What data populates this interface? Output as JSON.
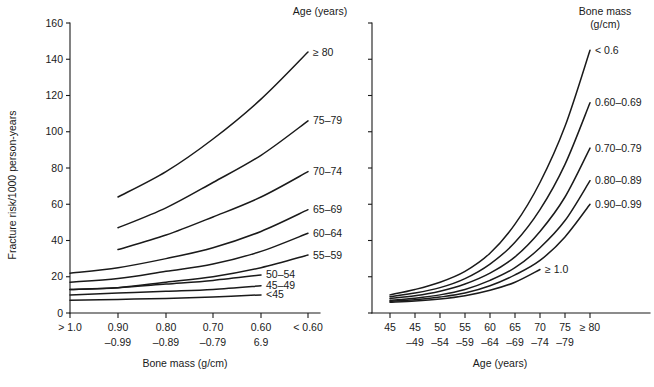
{
  "figure": {
    "background_color": "#ffffff",
    "line_color": "#1a1a1a"
  },
  "chart_data": [
    {
      "id": "left-panel",
      "type": "line",
      "title": "",
      "legend_title": "Age (years)",
      "legend_position": "right-of-plot",
      "grid": false,
      "xlabel": "Bone mass (g/cm)",
      "ylabel": "Fracture risk/1000 person-years",
      "ylim": [
        0,
        160
      ],
      "yticks": [
        0,
        20,
        40,
        60,
        80,
        100,
        120,
        140,
        160
      ],
      "categories": [
        "> 1.0",
        "0.90-0.99",
        "0.80-0.89",
        "0.70-0.79",
        "0.60-6.9",
        "< 0.60"
      ],
      "xtick_labels_top": [
        "> 1.0",
        "0.90",
        "0.80",
        "0.70",
        "0.60",
        "< 0.60"
      ],
      "xtick_labels_bottom": [
        "",
        "–0.99",
        "–0.89",
        "–0.79",
        "6.9",
        ""
      ],
      "series": [
        {
          "name": "≥ 80",
          "label": "≥ 80",
          "start_index": 1,
          "values": [
            null,
            64,
            78,
            96,
            118,
            144
          ]
        },
        {
          "name": "75–79",
          "label": "75–79",
          "start_index": 1,
          "values": [
            null,
            47,
            58,
            72,
            87,
            106
          ]
        },
        {
          "name": "70–74",
          "label": "70–74",
          "start_index": 1,
          "values": [
            null,
            35,
            43,
            53,
            64,
            78
          ]
        },
        {
          "name": "65–69",
          "label": "65–69",
          "start_index": 0,
          "values": [
            22,
            25,
            30,
            36,
            45,
            57
          ]
        },
        {
          "name": "60–64",
          "label": "60–64",
          "start_index": 0,
          "values": [
            17,
            19,
            23,
            27,
            34,
            44
          ]
        },
        {
          "name": "55–59",
          "label": "55–59",
          "start_index": 0,
          "values": [
            13,
            14,
            17,
            20,
            25,
            32
          ]
        },
        {
          "name": "50–54",
          "label": "50–54",
          "start_index": 0,
          "values": [
            13,
            14,
            16,
            18,
            21,
            null
          ]
        },
        {
          "name": "45–49",
          "label": "45–49",
          "start_index": 0,
          "values": [
            10,
            11,
            12,
            13,
            15,
            null
          ]
        },
        {
          "name": "<45",
          "label": "<45",
          "start_index": 0,
          "values": [
            7,
            7.5,
            8,
            8.8,
            10,
            null
          ]
        }
      ]
    },
    {
      "id": "right-panel",
      "type": "line",
      "title": "",
      "legend_title_line1": "Bone mass",
      "legend_title_line2": "(g/cm)",
      "legend_position": "right-of-plot",
      "grid": false,
      "xlabel": "Age (years)",
      "ylabel": "",
      "ylim": [
        0,
        160
      ],
      "yticks": [
        0,
        20,
        40,
        60,
        80,
        100,
        120,
        140,
        160
      ],
      "categories": [
        "45",
        "45-49",
        "50-54",
        "55-59",
        "60-64",
        "65-69",
        "70-74",
        "75-79",
        "≥ 80"
      ],
      "xtick_labels_top": [
        "45",
        "45",
        "50",
        "55",
        "60",
        "65",
        "70",
        "75",
        "≥ 80"
      ],
      "xtick_labels_bottom": [
        "",
        "–49",
        "–54",
        "–59",
        "–64",
        "–69",
        "–74",
        "–79",
        ""
      ],
      "series": [
        {
          "name": "< 0.6",
          "label": "< 0.6",
          "start_index": 0,
          "values": [
            10,
            13,
            17,
            23,
            33,
            49,
            72,
            103,
            145
          ]
        },
        {
          "name": "0.60–0.69",
          "label": "0.60–0.69",
          "start_index": 0,
          "values": [
            9,
            11,
            14,
            19,
            27,
            39,
            57,
            82,
            116
          ]
        },
        {
          "name": "0.70–0.79",
          "label": "0.70–0.79",
          "start_index": 0,
          "values": [
            8,
            9.5,
            12,
            16,
            22,
            31,
            45,
            64,
            91
          ]
        },
        {
          "name": "0.80–0.89",
          "label": "0.80–0.89",
          "start_index": 0,
          "values": [
            7,
            8.2,
            10,
            13,
            18,
            25,
            36,
            51,
            73
          ]
        },
        {
          "name": "0.90–0.99",
          "label": "0.90–0.99",
          "start_index": 0,
          "values": [
            6.5,
            7.3,
            8.8,
            11,
            15,
            21,
            29,
            42,
            60
          ]
        },
        {
          "name": "≥ 1.0",
          "label": "≥ 1.0",
          "start_index": 0,
          "values": [
            6,
            6.6,
            7.7,
            9.5,
            12.5,
            17,
            24,
            null,
            null
          ]
        }
      ]
    }
  ]
}
